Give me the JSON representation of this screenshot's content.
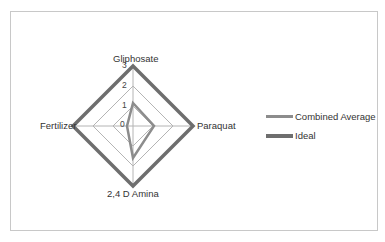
{
  "chart_data": {
    "type": "radar",
    "title": "",
    "categories": [
      "Gliphosate",
      "Paraquat",
      "2,4 D Amina",
      "Fertilizer"
    ],
    "radial_axis": {
      "min": 0,
      "max": 3,
      "ticks": [
        "0",
        "1",
        "2",
        "3"
      ]
    },
    "series": [
      {
        "name": "Combined Average",
        "values": [
          1.15,
          1.05,
          1.6,
          0.3
        ],
        "color": "#8c8c8c",
        "line_width": 2.5
      },
      {
        "name": "Ideal",
        "values": [
          3,
          3,
          3,
          3
        ],
        "color": "#6e6e6e",
        "line_width": 3.5
      }
    ],
    "legend_position": "right",
    "grid": true
  },
  "legend": {
    "items": [
      {
        "label": "Combined Average",
        "color": "#8c8c8c"
      },
      {
        "label": "Ideal",
        "color": "#6e6e6e"
      }
    ]
  }
}
